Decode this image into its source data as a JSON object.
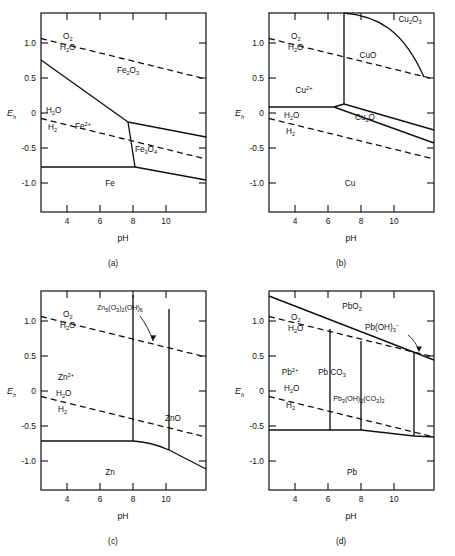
{
  "figure": {
    "kind": "pourbaix-diagram-set",
    "panel_count": 4
  },
  "axes": {
    "x_label": "pH",
    "y_label": "E",
    "y_label_sub": "h",
    "x_ticks": [
      "4",
      "6",
      "8",
      "10"
    ],
    "x_tick_values": [
      4,
      6,
      8,
      10
    ],
    "y_ticks": [
      "1.0",
      "0.5",
      "0",
      "-0.5",
      "-1.0"
    ],
    "y_tick_values": [
      1.0,
      0.5,
      0,
      -0.5,
      -1.0
    ],
    "xlim": [
      2.4,
      12.4
    ],
    "ylim": [
      -1.4,
      1.45
    ]
  },
  "water_lines": {
    "upper_top_label": "O",
    "upper_top_sub": "2",
    "upper_bottom_label": "H",
    "upper_bottom_sub": "2",
    "upper_bottom_tail": "O",
    "lower_top_label": "H",
    "lower_top_sub": "2",
    "lower_top_tail": "O",
    "lower_bottom_label": "H",
    "lower_bottom_sub": "2"
  },
  "panels": [
    {
      "id": "a",
      "caption": "(a)",
      "system": "Fe",
      "regions": [
        {
          "name": "Fe2O3",
          "base": "Fe",
          "parts": [
            {
              "t": "Fe"
            },
            {
              "t": "2",
              "s": "sub"
            },
            {
              "t": "O"
            },
            {
              "t": "3",
              "s": "sub"
            }
          ],
          "x": 128,
          "y": 73
        },
        {
          "name": "Fe2+",
          "parts": [
            {
              "t": "Fe"
            },
            {
              "t": "2+",
              "s": "sup"
            }
          ],
          "x": 83,
          "y": 129
        },
        {
          "name": "Fe3O4",
          "parts": [
            {
              "t": "Fe"
            },
            {
              "t": "3",
              "s": "sub"
            },
            {
              "t": "O"
            },
            {
              "t": "4",
              "s": "sub"
            }
          ],
          "x": 146,
          "y": 152
        },
        {
          "name": "Fe",
          "parts": [
            {
              "t": "Fe"
            }
          ],
          "x": 110,
          "y": 186
        }
      ]
    },
    {
      "id": "b",
      "caption": "(b)",
      "system": "Cu",
      "regions": [
        {
          "name": "Cu2O3",
          "parts": [
            {
              "t": "Cu"
            },
            {
              "t": "2",
              "s": "sub"
            },
            {
              "t": "O"
            },
            {
              "t": "3",
              "s": "sub"
            }
          ],
          "x": 182,
          "y": 22
        },
        {
          "name": "CuO",
          "parts": [
            {
              "t": "CuO"
            }
          ],
          "x": 140,
          "y": 58
        },
        {
          "name": "Cu2+",
          "parts": [
            {
              "t": "Cu"
            },
            {
              "t": "2+",
              "s": "sup"
            }
          ],
          "x": 76,
          "y": 93
        },
        {
          "name": "Cu2O",
          "parts": [
            {
              "t": "Cu"
            },
            {
              "t": "2",
              "s": "sub"
            },
            {
              "t": "O"
            }
          ],
          "x": 137,
          "y": 120
        },
        {
          "name": "Cu",
          "parts": [
            {
              "t": "Cu"
            }
          ],
          "x": 122,
          "y": 186
        }
      ]
    },
    {
      "id": "c",
      "caption": "(c)",
      "system": "Zn",
      "regions": [
        {
          "name": "Zn5(CO3)2(OH)6",
          "parts": [
            {
              "t": "Zn"
            },
            {
              "t": "5",
              "s": "sub"
            },
            {
              "t": "(O"
            },
            {
              "t": "3",
              "s": "sub"
            },
            {
              "t": ")"
            },
            {
              "t": "2",
              "s": "sub"
            },
            {
              "t": "(OH)"
            },
            {
              "t": "6",
              "s": "sub"
            }
          ],
          "x": 120,
          "y": 32
        },
        {
          "name": "Zn2+",
          "parts": [
            {
              "t": "Zn"
            },
            {
              "t": "2+",
              "s": "sup"
            }
          ],
          "x": 66,
          "y": 102
        },
        {
          "name": "ZnO",
          "parts": [
            {
              "t": "ZnO"
            }
          ],
          "x": 173,
          "y": 143
        },
        {
          "name": "Zn",
          "parts": [
            {
              "t": "Zn"
            }
          ],
          "x": 110,
          "y": 197
        }
      ]
    },
    {
      "id": "d",
      "caption": "(d)",
      "system": "Pb",
      "regions": [
        {
          "name": "PbO2",
          "parts": [
            {
              "t": "PbO"
            },
            {
              "t": "2",
              "s": "sub"
            }
          ],
          "x": 124,
          "y": 31
        },
        {
          "name": "Pb(OH)3-",
          "parts": [
            {
              "t": "Pb(OH)"
            },
            {
              "t": "3",
              "s": "sub"
            },
            {
              "t": "−",
              "s": "sup"
            }
          ],
          "x": 154,
          "y": 52
        },
        {
          "name": "Pb2+",
          "parts": [
            {
              "t": "Pb"
            },
            {
              "t": "2+",
              "s": "sup"
            }
          ],
          "x": 62,
          "y": 97
        },
        {
          "name": "PbCO3",
          "parts": [
            {
              "t": "Pb CO"
            },
            {
              "t": "3",
              "s": "sub"
            }
          ],
          "x": 104,
          "y": 97
        },
        {
          "name": "Pb3(OH)2(CO3)2",
          "parts": [
            {
              "t": "Pb"
            },
            {
              "t": "3",
              "s": "sub"
            },
            {
              "t": "(OH)"
            },
            {
              "t": "2",
              "s": "sub"
            },
            {
              "t": "(CO"
            },
            {
              "t": "3",
              "s": "sub"
            },
            {
              "t": ")"
            },
            {
              "t": "2",
              "s": "sub"
            }
          ],
          "x": 131,
          "y": 123
        },
        {
          "name": "Pb",
          "parts": [
            {
              "t": "Pb"
            }
          ],
          "x": 124,
          "y": 197
        }
      ]
    }
  ],
  "colors": {
    "ink": "#111111",
    "background": "#ffffff"
  }
}
